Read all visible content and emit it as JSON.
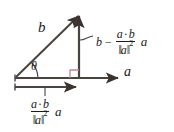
{
  "figure": {
    "background_color": "#ffffff",
    "stroke_color": "#4a4440",
    "right_angle_color": "#c08890",
    "text_color": "#1a1a1a"
  },
  "labels": {
    "vector_b": "b",
    "vector_a": "a",
    "angle_theta": "θ"
  },
  "orthogonal_component": {
    "lead_term": "b",
    "minus": "−",
    "numerator_left": "a",
    "numerator_dot": "·",
    "numerator_right": "b",
    "denominator_open": "‖",
    "denominator_var": "a",
    "denominator_close": "‖",
    "denominator_exponent": "2",
    "trailing_vector": "a"
  },
  "projection_component": {
    "numerator_left": "a",
    "numerator_dot": "·",
    "numerator_right": "b",
    "denominator_open": "‖",
    "denominator_var": "a",
    "denominator_close": "‖",
    "denominator_exponent": "2",
    "trailing_vector": "a"
  },
  "geometry": {
    "origin": [
      15,
      78
    ],
    "apex": [
      79,
      13
    ],
    "axis_end": [
      120,
      78
    ],
    "projection_arrow_end": [
      79,
      87
    ],
    "right_angle_size": 8
  }
}
